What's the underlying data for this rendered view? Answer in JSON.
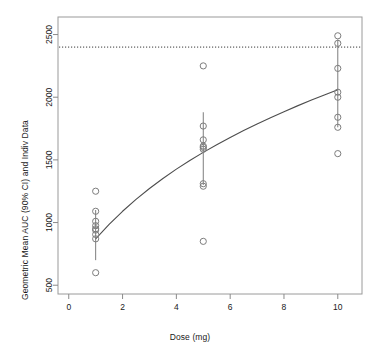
{
  "chart_data": {
    "type": "scatter",
    "title": "",
    "xlabel": "Dose (mg)",
    "ylabel": "Geometric Mean AUC (90% CI) and Indiv Data",
    "xlim": [
      -0.4,
      10.9
    ],
    "ylim": [
      430,
      2640
    ],
    "xticks": [
      0,
      2,
      4,
      6,
      8,
      10
    ],
    "xtick_labels": [
      "0",
      "2",
      "4",
      "6",
      "8",
      "10"
    ],
    "yticks": [
      500,
      1000,
      1500,
      2000,
      2500
    ],
    "ytick_labels": [
      "500",
      "1000",
      "1500",
      "2000",
      "2500"
    ],
    "grid": false,
    "legend": "none",
    "reference_line": {
      "name": "threshold",
      "orientation": "horizontal",
      "y": 2400,
      "style": "dotted"
    },
    "fit_curve": {
      "name": "model-predicted-mean",
      "style": "solid",
      "x": [
        1.0,
        1.5,
        2.0,
        2.5,
        3.0,
        3.5,
        4.0,
        4.5,
        5.0,
        5.5,
        6.0,
        6.5,
        7.0,
        7.5,
        8.0,
        8.5,
        9.0,
        9.5,
        10.0
      ],
      "y": [
        870,
        985,
        1090,
        1185,
        1272,
        1352,
        1426,
        1495,
        1560,
        1621,
        1679,
        1734,
        1787,
        1837,
        1885,
        1931,
        1975,
        2018,
        2060
      ]
    },
    "error_bars": [
      {
        "dose": 1,
        "mean": 950,
        "lower": 700,
        "upper": 1100
      },
      {
        "dose": 5,
        "mean": 1600,
        "lower": 1300,
        "upper": 1880
      },
      {
        "dose": 10,
        "mean": 2000,
        "lower": 1760,
        "upper": 2460
      }
    ],
    "series": [
      {
        "name": "Individual Data",
        "marker": "open-circle",
        "points": [
          {
            "x": 1,
            "y": 1250
          },
          {
            "x": 1,
            "y": 1090
          },
          {
            "x": 1,
            "y": 1010
          },
          {
            "x": 1,
            "y": 975
          },
          {
            "x": 1,
            "y": 940
          },
          {
            "x": 1,
            "y": 905
          },
          {
            "x": 1,
            "y": 870
          },
          {
            "x": 1,
            "y": 600
          },
          {
            "x": 5,
            "y": 2250
          },
          {
            "x": 5,
            "y": 1770
          },
          {
            "x": 5,
            "y": 1660
          },
          {
            "x": 5,
            "y": 1610
          },
          {
            "x": 5,
            "y": 1585
          },
          {
            "x": 5,
            "y": 1310
          },
          {
            "x": 5,
            "y": 1290
          },
          {
            "x": 5,
            "y": 850
          },
          {
            "x": 10,
            "y": 2490
          },
          {
            "x": 10,
            "y": 2430
          },
          {
            "x": 10,
            "y": 2230
          },
          {
            "x": 10,
            "y": 2040
          },
          {
            "x": 10,
            "y": 1840
          },
          {
            "x": 10,
            "y": 1760
          },
          {
            "x": 10,
            "y": 1550
          }
        ]
      }
    ]
  },
  "axes": {
    "xlabel": "Dose (mg)",
    "ylabel": "Geometric Mean AUC (90% CI) and Indiv Data"
  },
  "colors": {
    "ink": "#1a1a1a",
    "frame": "#8a8a8a",
    "marker": "#7d7d7d",
    "curve": "#4d4d4d",
    "reference": "#3a3a3a",
    "background": "#ffffff"
  }
}
